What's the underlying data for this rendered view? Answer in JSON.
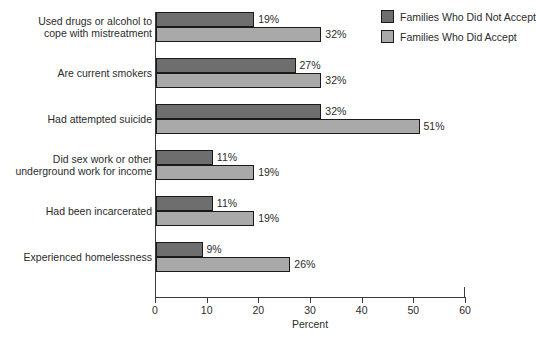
{
  "chart_data": {
    "type": "bar",
    "orientation": "horizontal",
    "title": "",
    "xlabel": "Percent",
    "ylabel": "",
    "xlim": [
      0,
      60
    ],
    "xticks": [
      0,
      10,
      20,
      30,
      40,
      50,
      60
    ],
    "xtick_labels": [
      "0",
      "10",
      "20",
      "30",
      "40",
      "50",
      "60"
    ],
    "grid": false,
    "legend_position": "top-right",
    "categories": [
      "Used drugs or alcohol to\ncope with mistreatment",
      "Are current smokers",
      "Had attempted suicide",
      "Did sex work or other\nunderground work for income",
      "Had been incarcerated",
      "Experienced homelessness"
    ],
    "series": [
      {
        "name": "Families Who Did Not Accept",
        "color": "#6e6e6e",
        "values": [
          19,
          27,
          32,
          11,
          11,
          9
        ],
        "value_labels": [
          "19%",
          "27%",
          "32%",
          "11%",
          "11%",
          "9%"
        ]
      },
      {
        "name": "Families Who Did Accept",
        "color": "#a9a9a9",
        "values": [
          32,
          32,
          51,
          19,
          19,
          26
        ],
        "value_labels": [
          "32%",
          "32%",
          "51%",
          "19%",
          "19%",
          "26%"
        ]
      }
    ]
  },
  "legend": {
    "items": [
      {
        "label": "Families Who Did Not Accept",
        "color": "#6e6e6e"
      },
      {
        "label": "Families Who Did Accept",
        "color": "#a9a9a9"
      }
    ]
  },
  "axis": {
    "x_title": "Percent"
  }
}
